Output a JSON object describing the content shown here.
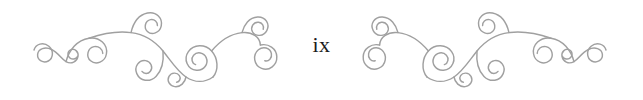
{
  "page": {
    "width": 643,
    "height": 100,
    "background_color": "#ffffff",
    "kind": "book-page-header-ornament"
  },
  "page_number": {
    "label": "ix",
    "numeral_system": "roman-lowercase",
    "value": 9,
    "color": "#1b1b1b",
    "font_size_px": 22,
    "align": "center"
  },
  "ornaments": {
    "stroke_color": "#a0a0a0",
    "stroke_width": 1.45,
    "count": 2,
    "left": {
      "name": "flourish-ornament-left",
      "mirrored": false,
      "description": "calligraphic scroll flourish with seven spirals"
    },
    "right": {
      "name": "flourish-ornament-right",
      "mirrored": true,
      "description": "horizontally mirrored copy of the left flourish"
    }
  }
}
